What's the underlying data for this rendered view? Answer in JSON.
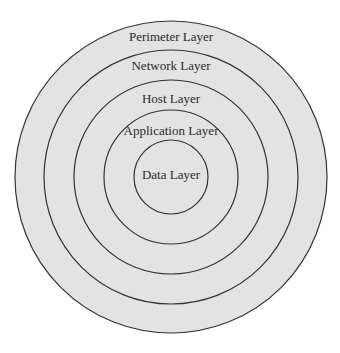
{
  "diagram": {
    "type": "concentric-layers",
    "fill_color": "#e3e3e3",
    "stroke_color": "#333333",
    "layers": [
      {
        "label": "Perimeter Layer",
        "radius": 156,
        "label_y": 40
      },
      {
        "label": "Network Layer",
        "radius": 127,
        "label_y": 69
      },
      {
        "label": "Host Layer",
        "radius": 97,
        "label_y": 103
      },
      {
        "label": "Application Layer",
        "radius": 67,
        "label_y": 135
      },
      {
        "label": "Data Layer",
        "radius": 37,
        "label_y": 179
      }
    ]
  }
}
